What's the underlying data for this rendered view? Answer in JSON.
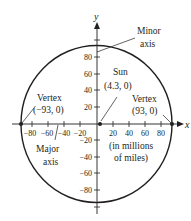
{
  "diagram": {
    "axes": {
      "x_label": "x",
      "y_label": "y",
      "x_ticks": [
        "−80",
        "−60",
        "−40",
        "−20",
        "20",
        "40",
        "60",
        "80"
      ],
      "y_ticks": [
        "80",
        "60",
        "40",
        "20",
        "−20",
        "−40",
        "−60",
        "−80"
      ]
    },
    "labels": {
      "minor_axis_line1": "Minor",
      "minor_axis_line2": "axis",
      "sun_name": "Sun",
      "sun_coords": "(4.3, 0)",
      "vertex_left_name": "Vertex",
      "vertex_left_coords": "(−93, 0)",
      "vertex_right_name": "Vertex",
      "vertex_right_coords": "(93, 0)",
      "major_axis_line1": "Major",
      "major_axis_line2": "axis",
      "units_line1": "(in millions",
      "units_line2": "of miles)"
    },
    "points": [
      {
        "name": "Sun",
        "x": 4.3,
        "y": 0
      },
      {
        "name": "Left vertex",
        "x": -93,
        "y": 0
      },
      {
        "name": "Right vertex",
        "x": 93,
        "y": 0
      }
    ],
    "colors": {
      "ink": "#231f20",
      "background": "#ffffff"
    }
  }
}
